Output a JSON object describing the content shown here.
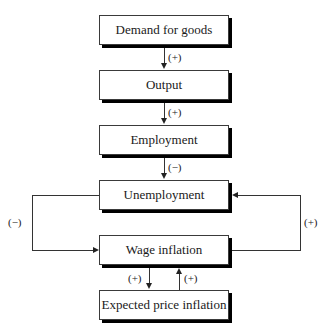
{
  "diagram": {
    "nodes": [
      {
        "id": "demand",
        "label": "Demand for goods"
      },
      {
        "id": "output",
        "label": "Output"
      },
      {
        "id": "employment",
        "label": "Employment"
      },
      {
        "id": "unemployment",
        "label": "Unemployment"
      },
      {
        "id": "wage",
        "label": "Wage inflation"
      },
      {
        "id": "expected",
        "label": "Expected price inflation"
      }
    ],
    "edges": [
      {
        "from": "demand",
        "to": "output",
        "sign": "(+)"
      },
      {
        "from": "output",
        "to": "employment",
        "sign": "(+)"
      },
      {
        "from": "employment",
        "to": "unemployment",
        "sign": "(−)"
      },
      {
        "from": "unemployment",
        "to": "wage",
        "sign": "(−)",
        "route": "left-loop"
      },
      {
        "from": "wage",
        "to": "unemployment",
        "sign": "(+)",
        "route": "right-loop"
      },
      {
        "from": "wage",
        "to": "expected",
        "sign": "(+)"
      },
      {
        "from": "expected",
        "to": "wage",
        "sign": "(+)"
      }
    ]
  }
}
